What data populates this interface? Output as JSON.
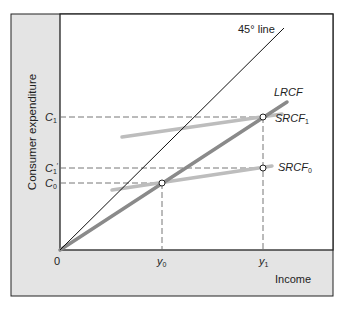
{
  "diagram": {
    "y_axis_label": "Consumer expenditure",
    "x_axis_label": "Income",
    "origin_label": "0",
    "y_ticks": [
      {
        "label": "C",
        "sub": "1",
        "prime": false
      },
      {
        "label": "C",
        "sub": "1",
        "prime": true
      },
      {
        "label": "C",
        "sub": "0",
        "prime": false
      }
    ],
    "x_ticks": [
      {
        "label": "y",
        "sub": "0"
      },
      {
        "label": "y",
        "sub": "1"
      }
    ],
    "lines": {
      "line45": "45° line",
      "lrcf": "LRCF",
      "srcf1": {
        "label": "SRCF",
        "sub": "1"
      },
      "srcf0": {
        "label": "SRCF",
        "sub": "0"
      }
    },
    "colors": {
      "frame_bg": "#e4e4e4",
      "plot_bg": "#ffffff",
      "lrcf": "#8a8a8a",
      "srcf": "#bdbdbd",
      "axis": "#222222"
    }
  }
}
